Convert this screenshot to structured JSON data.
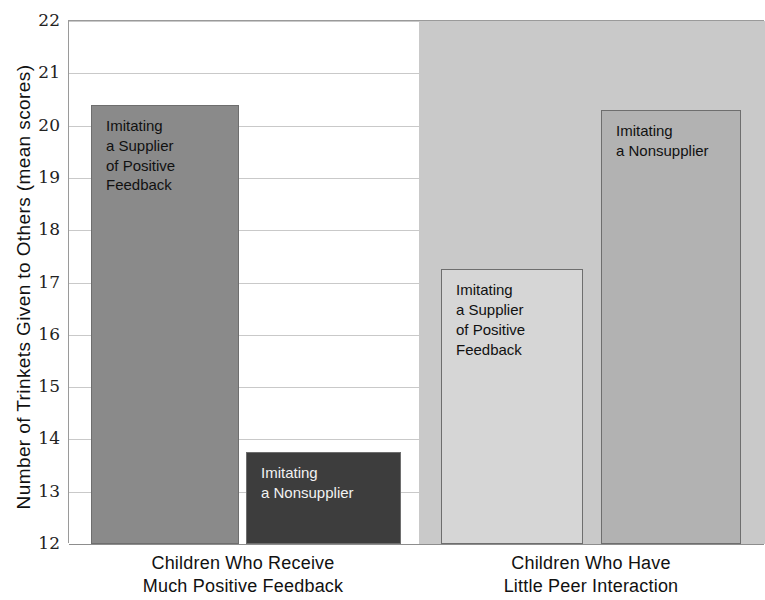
{
  "chart_data": {
    "type": "bar",
    "title": "",
    "xlabel": "",
    "ylabel": "Number of Trinkets Given to Others (mean scores)",
    "ylim": [
      12,
      22
    ],
    "ytick_labels": [
      "22",
      "21",
      "20",
      "19",
      "18",
      "17",
      "16",
      "15",
      "14",
      "13",
      "12"
    ],
    "yticks": [
      22,
      21,
      20,
      19,
      18,
      17,
      16,
      15,
      14,
      13,
      12
    ],
    "grid": true,
    "legend": "none",
    "categories": [
      "Children Who Receive\nMuch Positive Feedback",
      "Children Who Have\nLittle Peer Interaction"
    ],
    "series": [
      {
        "name": "Imitating a Supplier of Positive Feedback",
        "values": [
          20.4,
          17.25
        ]
      },
      {
        "name": "Imitating a Nonsupplier",
        "values": [
          13.75,
          20.3
        ]
      }
    ],
    "bars": [
      {
        "group": 0,
        "label": "Imitating\na Supplier\nof Positive\nFeedback",
        "value": 20.4,
        "color": "#8a8a8a",
        "text_color": "dark"
      },
      {
        "group": 0,
        "label": "Imitating\na Nonsupplier",
        "value": 13.75,
        "color": "#3d3d3d",
        "text_color": "light"
      },
      {
        "group": 1,
        "label": "Imitating\na Supplier\nof Positive\nFeedback",
        "value": 17.25,
        "color": "#d6d6d6",
        "text_color": "dark"
      },
      {
        "group": 1,
        "label": "Imitating\na Nonsupplier",
        "value": 20.3,
        "color": "#b2b2b2",
        "text_color": "dark"
      }
    ],
    "panel_colors": {
      "left_background": "#ffffff",
      "right_background": "#c9c9c9",
      "gridline": "#c9c9c9",
      "axis": "#8d8d8d"
    }
  }
}
